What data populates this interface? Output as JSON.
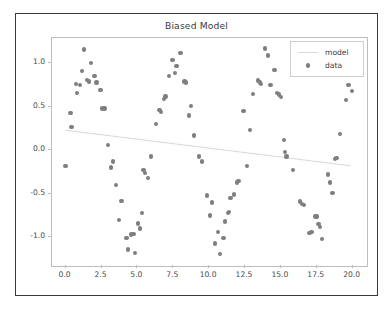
{
  "figure": {
    "title": "Biased Model",
    "background": "#ffffff",
    "border_color": "#3b3b3b"
  },
  "legend": {
    "position": "upper-right",
    "entries": [
      {
        "label": "model",
        "type": "line",
        "color": "#d8d8d8"
      },
      {
        "label": "data",
        "type": "marker",
        "color": "#7f7f7f"
      }
    ]
  },
  "chart_data": {
    "type": "scatter",
    "title": "Biased Model",
    "xlabel": "",
    "ylabel": "",
    "xlim": [
      -0.95,
      21.0
    ],
    "ylim": [
      -1.33,
      1.29
    ],
    "grid": false,
    "xticks": [
      "0.0",
      "2.5",
      "5.0",
      "7.5",
      "10.0",
      "12.5",
      "15.0",
      "17.5",
      "20.0"
    ],
    "xtick_values": [
      0.0,
      2.5,
      5.0,
      7.5,
      10.0,
      12.5,
      15.0,
      17.5,
      20.0
    ],
    "yticks": [
      "1.0",
      "0.5",
      "0.0",
      "-0.5",
      "-1.0"
    ],
    "ytick_values": [
      1.0,
      0.5,
      0.0,
      -0.5,
      -1.0
    ],
    "legend_position": "upper right",
    "marker_color": "#7f7f7f",
    "marker_size": 4.4,
    "line_color": "#d8d8d8",
    "series": [
      {
        "name": "data",
        "type": "scatter",
        "points": [
          [
            0.0,
            -0.18
          ],
          [
            0.35,
            0.43
          ],
          [
            0.42,
            0.27
          ],
          [
            0.72,
            0.76
          ],
          [
            0.78,
            0.66
          ],
          [
            1.0,
            0.75
          ],
          [
            1.12,
            0.91
          ],
          [
            1.3,
            1.16
          ],
          [
            1.48,
            0.81
          ],
          [
            1.62,
            0.79
          ],
          [
            1.78,
            1.0
          ],
          [
            2.0,
            0.85
          ],
          [
            2.15,
            0.78
          ],
          [
            2.42,
            0.69
          ],
          [
            2.55,
            0.48
          ],
          [
            2.72,
            0.48
          ],
          [
            2.95,
            0.06
          ],
          [
            3.18,
            -0.2
          ],
          [
            3.3,
            -0.13
          ],
          [
            3.52,
            -0.4
          ],
          [
            3.72,
            -0.8
          ],
          [
            3.9,
            -0.58
          ],
          [
            4.25,
            -1.01
          ],
          [
            4.35,
            -1.14
          ],
          [
            4.55,
            -0.97
          ],
          [
            4.72,
            -0.96
          ],
          [
            4.85,
            -1.18
          ],
          [
            5.05,
            -0.84
          ],
          [
            5.18,
            -0.9
          ],
          [
            5.3,
            -0.72
          ],
          [
            5.42,
            -0.23
          ],
          [
            5.55,
            -0.26
          ],
          [
            5.72,
            -0.32
          ],
          [
            5.95,
            -0.07
          ],
          [
            6.3,
            0.3
          ],
          [
            6.55,
            0.46
          ],
          [
            6.65,
            0.44
          ],
          [
            6.85,
            0.59
          ],
          [
            6.95,
            0.62
          ],
          [
            7.2,
            0.85
          ],
          [
            7.45,
            1.04
          ],
          [
            7.6,
            0.89
          ],
          [
            7.72,
            0.97
          ],
          [
            8.0,
            1.12
          ],
          [
            8.28,
            0.79
          ],
          [
            8.38,
            0.78
          ],
          [
            8.6,
            0.4
          ],
          [
            8.75,
            0.51
          ],
          [
            8.95,
            0.17
          ],
          [
            9.3,
            -0.07
          ],
          [
            9.5,
            -0.13
          ],
          [
            9.85,
            -0.52
          ],
          [
            10.05,
            -0.75
          ],
          [
            10.2,
            -0.6
          ],
          [
            10.42,
            -1.07
          ],
          [
            10.6,
            -0.94
          ],
          [
            10.75,
            -1.19
          ],
          [
            11.0,
            -1.01
          ],
          [
            11.12,
            -0.82
          ],
          [
            11.3,
            -0.72
          ],
          [
            11.38,
            -0.71
          ],
          [
            11.5,
            -0.55
          ],
          [
            11.72,
            -0.51
          ],
          [
            11.95,
            -0.37
          ],
          [
            12.05,
            -0.35
          ],
          [
            12.4,
            0.45
          ],
          [
            12.62,
            -0.18
          ],
          [
            12.85,
            0.23
          ],
          [
            13.05,
            0.65
          ],
          [
            13.42,
            0.8
          ],
          [
            13.55,
            0.78
          ],
          [
            13.62,
            0.76
          ],
          [
            13.9,
            1.17
          ],
          [
            14.1,
            1.09
          ],
          [
            14.28,
            0.75
          ],
          [
            14.55,
            0.92
          ],
          [
            14.72,
            0.66
          ],
          [
            14.85,
            0.64
          ],
          [
            15.0,
            0.61
          ],
          [
            15.2,
            0.12
          ],
          [
            15.3,
            -0.02
          ],
          [
            15.4,
            -0.07
          ],
          [
            15.85,
            -0.23
          ],
          [
            16.35,
            -0.59
          ],
          [
            16.45,
            -0.62
          ],
          [
            16.6,
            -0.63
          ],
          [
            17.0,
            -0.95
          ],
          [
            17.12,
            -0.94
          ],
          [
            17.4,
            -0.76
          ],
          [
            17.5,
            -0.76
          ],
          [
            17.62,
            -0.85
          ],
          [
            17.72,
            -0.88
          ],
          [
            17.85,
            -1.02
          ],
          [
            18.3,
            -0.28
          ],
          [
            18.42,
            -0.37
          ],
          [
            18.6,
            -0.49
          ],
          [
            18.78,
            -0.1
          ],
          [
            18.88,
            -0.09
          ],
          [
            19.1,
            0.19
          ],
          [
            19.55,
            0.58
          ],
          [
            19.7,
            0.75
          ],
          [
            19.95,
            0.68
          ]
        ]
      },
      {
        "name": "model",
        "type": "line",
        "points": [
          [
            0.0,
            0.22
          ],
          [
            20.0,
            -0.19
          ]
        ]
      }
    ]
  }
}
